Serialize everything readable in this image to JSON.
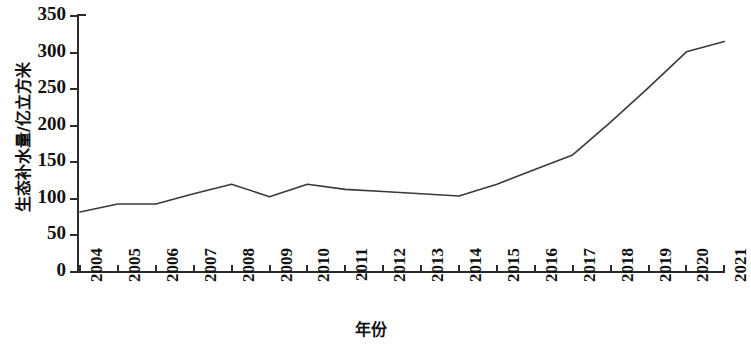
{
  "chart_data": {
    "type": "line",
    "title": "",
    "xlabel": "年份",
    "ylabel": "生态补水量/亿立方米",
    "x": [
      2004,
      2005,
      2006,
      2007,
      2008,
      2009,
      2010,
      2011,
      2012,
      2013,
      2014,
      2015,
      2016,
      2017,
      2018,
      2019,
      2020,
      2021
    ],
    "categories": [
      "2004",
      "2005",
      "2006",
      "2007",
      "2008",
      "2009",
      "2010",
      "2011",
      "2012",
      "2013",
      "2014",
      "2015",
      "2016",
      "2017",
      "2018",
      "2019",
      "2020",
      "2021"
    ],
    "values": [
      82,
      93,
      93,
      107,
      120,
      103,
      120,
      113,
      110,
      107,
      104,
      120,
      140,
      160,
      205,
      252,
      301,
      315
    ],
    "series": [
      {
        "name": "生态补水量",
        "values": [
          82,
          93,
          93,
          107,
          120,
          103,
          120,
          113,
          110,
          107,
          104,
          120,
          140,
          160,
          205,
          252,
          301,
          315
        ]
      }
    ],
    "ylim": [
      0,
      350
    ],
    "ytick_values": [
      0,
      50,
      100,
      150,
      200,
      250,
      300,
      350
    ],
    "ytick_labels": [
      "0",
      "50",
      "100",
      "150",
      "200",
      "250",
      "300",
      "350"
    ],
    "xlim": [
      2004,
      2021
    ],
    "grid": false,
    "legend": false,
    "markers": false,
    "line_color": "#3a3a3a",
    "line_width": 1.6,
    "axis_color": "#2b2b2b",
    "background": "#ffffff"
  }
}
